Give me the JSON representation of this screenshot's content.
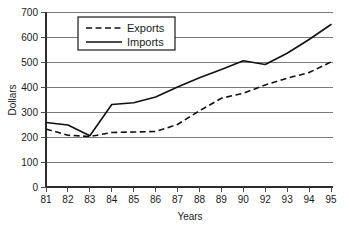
{
  "chart_data": {
    "type": "line",
    "title": "",
    "xlabel": "Years",
    "ylabel": "Dollars",
    "x": [
      "81",
      "82",
      "83",
      "84",
      "85",
      "86",
      "87",
      "88",
      "89",
      "90",
      "92",
      "93",
      "94",
      "95"
    ],
    "categories": [
      "81",
      "82",
      "83",
      "84",
      "85",
      "86",
      "87",
      "88",
      "89",
      "90",
      "92",
      "93",
      "94",
      "95"
    ],
    "xtick_labels": [
      "81",
      "82",
      "83",
      "84",
      "85",
      "86",
      "87",
      "88",
      "89",
      "90",
      "92",
      "93",
      "94",
      "95"
    ],
    "ytick_labels": [
      "0",
      "100",
      "200",
      "300",
      "400",
      "500",
      "600",
      "700"
    ],
    "yticks": [
      0,
      100,
      200,
      300,
      400,
      500,
      600,
      700
    ],
    "ylim": [
      0,
      700
    ],
    "grid": "horizontal",
    "legend_position": "top-left",
    "series": [
      {
        "name": "Exports",
        "style": "dashed",
        "color": "#111111",
        "values": [
          232,
          207,
          202,
          218,
          220,
          222,
          250,
          305,
          355,
          375,
          408,
          435,
          458,
          500
        ]
      },
      {
        "name": "Imports",
        "style": "solid",
        "color": "#111111",
        "values": [
          258,
          248,
          205,
          330,
          337,
          360,
          400,
          437,
          470,
          505,
          490,
          535,
          590,
          650
        ]
      }
    ]
  },
  "legend": {
    "entries": [
      {
        "label": "Exports",
        "style": "dashed"
      },
      {
        "label": "Imports",
        "style": "solid"
      }
    ]
  },
  "axes": {
    "y_title": "Dollars",
    "x_title": "Years"
  }
}
